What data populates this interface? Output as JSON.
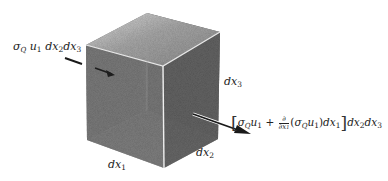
{
  "diagram": {
    "type": "control-volume-flux",
    "shape": "cube",
    "colors": {
      "background": "#ffffff",
      "face_dark": "#6e6e6e",
      "face_mid": "#8a8a8a",
      "face_light": "#c8c8c8",
      "text": "#222222",
      "arrow": "#222222"
    },
    "labels": {
      "inflow": {
        "sigma": "σ",
        "sigma_sub": "Q",
        "u": "u",
        "u_sub": "1",
        "d1": "dx",
        "d1_sub": "2",
        "d2": "dx",
        "d2_sub": "3"
      },
      "outflow": {
        "open_bracket": "[",
        "close_bracket": "]",
        "sigma": "σ",
        "sigma_sub": "Q",
        "u": "u",
        "u_sub": "1",
        "plus": " + ",
        "frac_num": "∂",
        "frac_den": "∂x",
        "frac_den_sub": "1",
        "paren_open": "(",
        "sigma2": "σ",
        "sigma2_sub": "Q",
        "u2": "u",
        "u2_sub": "1",
        "paren_close": ")",
        "dx": "dx",
        "dx_sub": "1",
        "tail1": "dx",
        "tail1_sub": "2",
        "tail2": "dx",
        "tail2_sub": "3"
      },
      "edge_dx1": {
        "text": "dx",
        "sub": "1"
      },
      "edge_dx2": {
        "text": "dx",
        "sub": "2"
      },
      "edge_dx3": {
        "text": "dx",
        "sub": "3"
      }
    }
  }
}
